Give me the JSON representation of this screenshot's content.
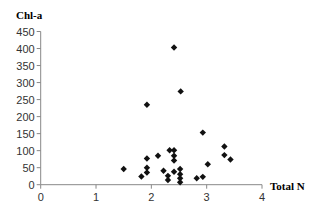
{
  "chart_data": {
    "type": "scatter",
    "title": "",
    "xlabel": "Total N",
    "ylabel": "Chl-a",
    "xlim": [
      0,
      4
    ],
    "ylim": [
      0,
      450
    ],
    "x_ticks": [
      0,
      1,
      2,
      3,
      4
    ],
    "y_ticks": [
      0,
      50,
      100,
      150,
      200,
      250,
      300,
      350,
      400,
      450
    ],
    "grid": false,
    "legend": null,
    "marker": "diamond",
    "marker_color": "#111111",
    "series": [
      {
        "name": "Chl-a vs Total N",
        "points": [
          [
            1.5,
            46
          ],
          [
            1.82,
            24
          ],
          [
            1.92,
            77
          ],
          [
            1.92,
            50
          ],
          [
            1.92,
            36
          ],
          [
            1.92,
            235
          ],
          [
            2.12,
            85
          ],
          [
            2.22,
            41
          ],
          [
            2.3,
            26
          ],
          [
            2.3,
            14
          ],
          [
            2.33,
            101
          ],
          [
            2.41,
            101
          ],
          [
            2.41,
            85
          ],
          [
            2.41,
            71
          ],
          [
            2.41,
            38
          ],
          [
            2.41,
            403
          ],
          [
            2.52,
            46
          ],
          [
            2.52,
            31
          ],
          [
            2.52,
            19
          ],
          [
            2.52,
            7
          ],
          [
            2.53,
            274
          ],
          [
            2.82,
            19
          ],
          [
            2.93,
            23
          ],
          [
            2.93,
            153
          ],
          [
            3.02,
            60
          ],
          [
            3.32,
            112
          ],
          [
            3.32,
            87
          ],
          [
            3.43,
            74
          ]
        ]
      }
    ]
  }
}
